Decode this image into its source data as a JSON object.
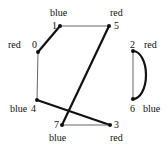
{
  "graph": {
    "nodes": [
      {
        "id": "0",
        "color": "red"
      },
      {
        "id": "1",
        "color": "blue"
      },
      {
        "id": "2",
        "color": "red"
      },
      {
        "id": "3",
        "color": "red"
      },
      {
        "id": "4",
        "color": "blue"
      },
      {
        "id": "5",
        "color": "red"
      },
      {
        "id": "6",
        "color": "blue"
      },
      {
        "id": "7",
        "color": "blue"
      }
    ],
    "edges": [
      {
        "from": "0",
        "to": "1",
        "weight": "thick"
      },
      {
        "from": "1",
        "to": "5",
        "weight": "thin"
      },
      {
        "from": "5",
        "to": "7",
        "weight": "thick"
      },
      {
        "from": "0",
        "to": "4",
        "weight": "thin"
      },
      {
        "from": "4",
        "to": "3",
        "weight": "thick"
      },
      {
        "from": "7",
        "to": "3",
        "weight": "thin"
      },
      {
        "from": "2",
        "to": "6",
        "weight": "thin",
        "shape": "straight"
      },
      {
        "from": "2",
        "to": "6",
        "weight": "thick",
        "shape": "arc"
      }
    ]
  }
}
